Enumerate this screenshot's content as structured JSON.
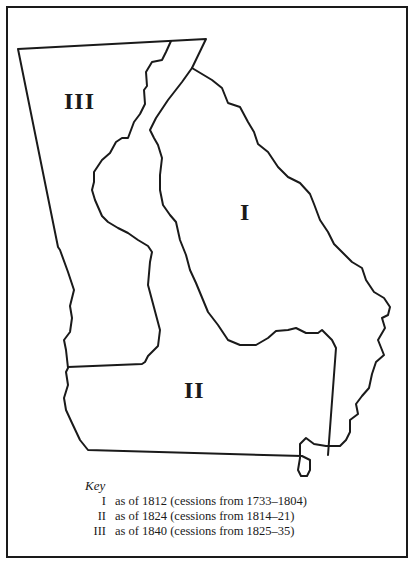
{
  "map": {
    "regions": [
      {
        "id": "I",
        "label": "I"
      },
      {
        "id": "II",
        "label": "II"
      },
      {
        "id": "III",
        "label": "III"
      }
    ],
    "stroke_color": "#1a1a1a",
    "background_color": "#ffffff"
  },
  "key": {
    "title": "Key",
    "items": [
      {
        "numeral": "I",
        "text": "as of 1812 (cessions from 1733–1804)"
      },
      {
        "numeral": "II",
        "text": "as of 1824 (cessions from 1814–21)"
      },
      {
        "numeral": "III",
        "text": "as of 1840 (cessions from 1825–35)"
      }
    ]
  }
}
